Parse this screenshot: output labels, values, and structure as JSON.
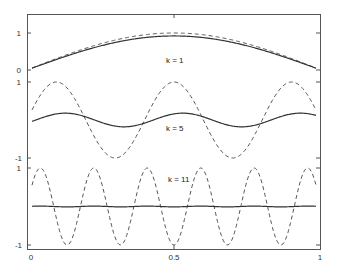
{
  "chart_data": {
    "type": "line",
    "title": "",
    "xlabel": "",
    "ylabel": "",
    "xlim": [
      0,
      1
    ],
    "x_ticks": [
      {
        "value": 0,
        "label": "0"
      },
      {
        "value": 0.5,
        "label": "0.5"
      },
      {
        "value": 1,
        "label": "1"
      }
    ],
    "grid": false,
    "legend": null,
    "colors": {
      "solid": "#333333",
      "dashed": "#555555",
      "axes": "#555555"
    },
    "panels": [
      {
        "annotation": "k = 1",
        "k": 1,
        "y_ticks": [
          {
            "value": 0,
            "label": "0"
          },
          {
            "value": 1,
            "label": "1"
          }
        ],
        "ylim": [
          0,
          1.5
        ],
        "series": [
          {
            "name": "exact sin(kπx)",
            "style": "dashed",
            "amplitude": 1.0,
            "phase": 0
          },
          {
            "name": "approximation",
            "style": "solid",
            "amplitude": 0.92,
            "phase": 0
          }
        ]
      },
      {
        "annotation": "k = 5",
        "k": 5,
        "y_ticks": [
          {
            "value": 1,
            "label": "1"
          },
          {
            "value": -1,
            "label": "-1"
          }
        ],
        "ylim": [
          -1,
          1
        ],
        "series": [
          {
            "name": "exact sin(kπx)",
            "style": "dashed",
            "amplitude": 1.0,
            "phase": 0
          },
          {
            "name": "approximation",
            "style": "solid",
            "amplitude": 0.18,
            "phase": 0.03
          }
        ]
      },
      {
        "annotation": "k = 11",
        "k": 11,
        "y_ticks": [
          {
            "value": 1,
            "label": "1"
          },
          {
            "value": -1,
            "label": "-1"
          }
        ],
        "ylim": [
          -1,
          1
        ],
        "series": [
          {
            "name": "exact sin(kπx)",
            "style": "dashed",
            "amplitude": 1.0,
            "phase": 0
          },
          {
            "name": "approximation",
            "style": "solid",
            "amplitude": 0.01,
            "phase": 0
          }
        ]
      }
    ]
  }
}
